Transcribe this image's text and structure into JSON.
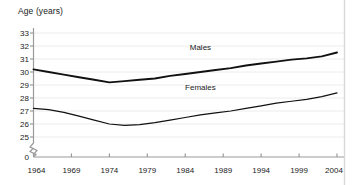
{
  "chart_data": {
    "type": "line",
    "title": "Age (years)",
    "xlabel": "",
    "ylabel": "Age (years)",
    "grid": true,
    "legend_position": "inline-on-lines",
    "xlim": [
      1964,
      2004
    ],
    "ylim": [
      25,
      33
    ],
    "y_axis_break": true,
    "y_break_symbol": "zigzag",
    "y_zero_label": "0",
    "ytick_labels": [
      "33",
      "32",
      "31",
      "30",
      "29",
      "28",
      "27",
      "26",
      "25"
    ],
    "ytick_values": [
      33,
      32,
      31,
      30,
      29,
      28,
      27,
      26,
      25
    ],
    "xtick_labels": [
      "1964",
      "1969",
      "1974",
      "1979",
      "1984",
      "1989",
      "1994",
      "1999",
      "2004"
    ],
    "xtick_values": [
      1964,
      1969,
      1974,
      1979,
      1984,
      1989,
      1994,
      1999,
      2004
    ],
    "x": [
      1964,
      1966,
      1968,
      1970,
      1972,
      1974,
      1976,
      1978,
      1980,
      1982,
      1984,
      1986,
      1988,
      1990,
      1992,
      1994,
      1996,
      1998,
      2000,
      2002,
      2004
    ],
    "series": [
      {
        "name": "Males",
        "color": "#111111",
        "label_x": 1986,
        "label_y": 31.55,
        "values": [
          30.2,
          30.0,
          29.8,
          29.6,
          29.4,
          29.2,
          29.3,
          29.4,
          29.5,
          29.7,
          29.85,
          30.0,
          30.15,
          30.3,
          30.5,
          30.65,
          30.8,
          30.95,
          31.05,
          31.2,
          31.5
        ]
      },
      {
        "name": "Females",
        "color": "#111111",
        "label_x": 1986,
        "label_y": 28.45,
        "values": [
          27.2,
          27.1,
          26.9,
          26.6,
          26.3,
          26.0,
          25.9,
          25.95,
          26.1,
          26.3,
          26.5,
          26.7,
          26.85,
          27.0,
          27.2,
          27.4,
          27.6,
          27.75,
          27.9,
          28.1,
          28.4
        ]
      }
    ],
    "colors": {
      "axis": "#9a9a9a",
      "grid": "#ececec",
      "line": "#111111",
      "text": "#1a1a1a",
      "right_rule": "#d8d8d8",
      "background": "#ffffff"
    }
  }
}
